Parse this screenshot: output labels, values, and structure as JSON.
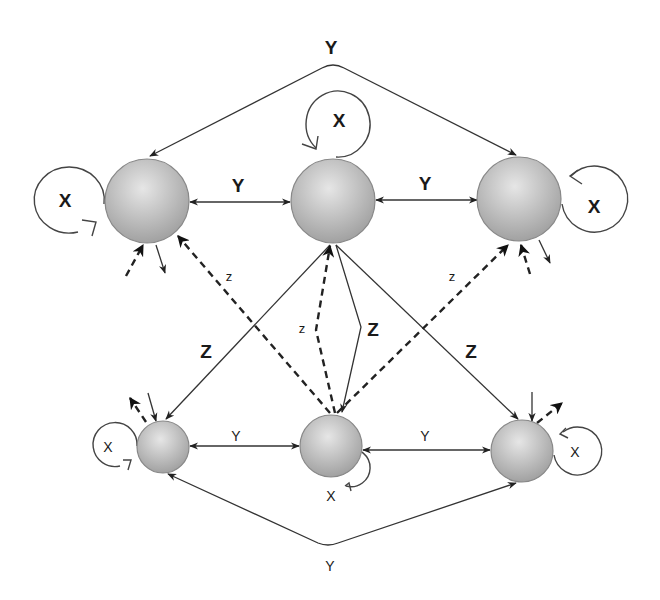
{
  "diagram": {
    "colors": {
      "node_light": "#e2e2e2",
      "node_dark": "#9a9a9a",
      "line": "#333333"
    },
    "nodes": [
      {
        "id": "top-left",
        "x": 147,
        "y": 201,
        "r": 42
      },
      {
        "id": "top-center",
        "x": 333,
        "y": 201,
        "r": 42
      },
      {
        "id": "top-right",
        "x": 519,
        "y": 199,
        "r": 42
      },
      {
        "id": "bottom-left",
        "x": 163,
        "y": 447,
        "r": 26
      },
      {
        "id": "bottom-center",
        "x": 331,
        "y": 446,
        "r": 31
      },
      {
        "id": "bottom-right",
        "x": 522,
        "y": 451,
        "r": 31
      }
    ],
    "labels": {
      "top_arc": "Y",
      "top_left_center": "Y",
      "top_center_right": "Y",
      "loop_top_left": "X",
      "loop_top_center": "X",
      "loop_top_right": "X",
      "z_left_dashed": "z",
      "z_center_dashed": "z",
      "z_right_dashed": "z",
      "Z_left": "Z",
      "Z_center": "Z",
      "Z_right": "Z",
      "bottom_left_center": "Y",
      "bottom_center_right": "Y",
      "loop_bottom_left": "X",
      "loop_bottom_center": "X",
      "loop_bottom_right": "X",
      "bottom_arc": "Y"
    }
  }
}
